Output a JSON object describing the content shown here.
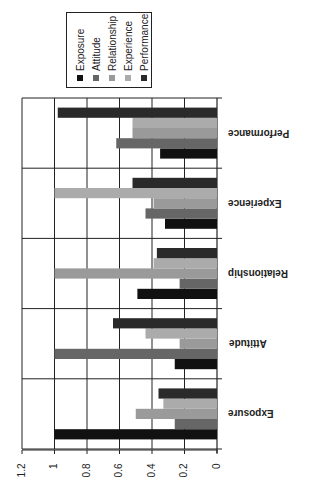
{
  "chart_data": {
    "type": "bar",
    "orientation": "rotated 90deg (value axis horizontal at bottom, increasing right-to-left; categories stacked vertically)",
    "title": "",
    "xlabel": "",
    "ylabel": "",
    "ylim": [
      0,
      1.2
    ],
    "yticks": [
      "0",
      "0.2",
      "0.4",
      "0.6",
      "0.8",
      "1",
      "1.2"
    ],
    "grid": true,
    "legend_position": "top",
    "categories": [
      "Exposure",
      "Attitude",
      "Relationship",
      "Experience",
      "Performance"
    ],
    "series": [
      {
        "name": "Exposure",
        "color": "#111111",
        "values": [
          1.0,
          0.26,
          0.49,
          0.32,
          0.35
        ]
      },
      {
        "name": "Attitude",
        "color": "#666666",
        "values": [
          0.26,
          1.0,
          0.23,
          0.44,
          0.62
        ]
      },
      {
        "name": "Relationship",
        "color": "#9a9a9a",
        "values": [
          0.5,
          0.23,
          1.0,
          0.39,
          0.52
        ]
      },
      {
        "name": "Experience",
        "color": "#ababab",
        "values": [
          0.33,
          0.44,
          0.39,
          1.0,
          0.52
        ]
      },
      {
        "name": "Performance",
        "color": "#2a2a2a",
        "values": [
          0.36,
          0.64,
          0.37,
          0.52,
          0.98
        ]
      }
    ]
  },
  "legend": {
    "items": [
      "Exposure",
      "Attitude",
      "Relationship",
      "Experience",
      "Performance"
    ]
  },
  "axis": {
    "tick_labels": [
      "0",
      "0.2",
      "0.4",
      "0.6",
      "0.8",
      "1",
      "1.2"
    ]
  },
  "categories": {
    "labels": [
      "Performance",
      "Experience",
      "Relationship",
      "Attitude",
      "Exposure"
    ]
  }
}
